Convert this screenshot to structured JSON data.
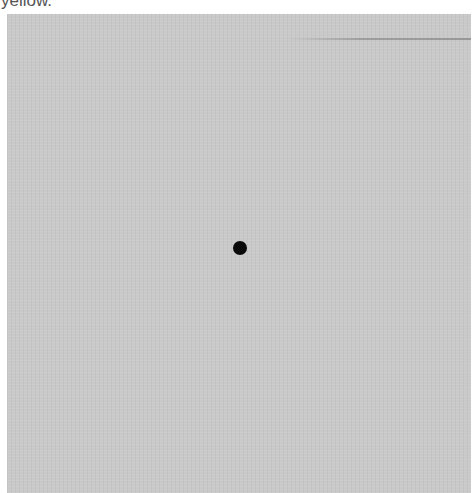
{
  "caption": {
    "text": "yellow."
  },
  "panel": {
    "background_color": "#c9c9c9",
    "dot": {
      "color": "#0a0a0a",
      "center_x": 240,
      "center_y": 248,
      "diameter": 14
    }
  }
}
